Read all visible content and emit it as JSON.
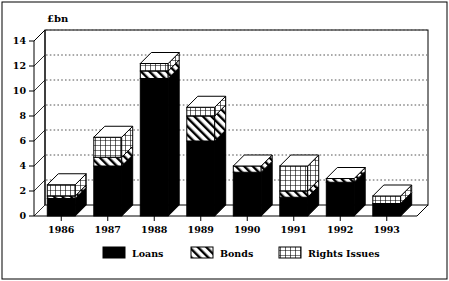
{
  "chart_data": {
    "type": "bar",
    "title": "",
    "subtitle": "",
    "xlabel": "",
    "ylabel": "£bn",
    "unit_label": "£bn",
    "stacked": true,
    "style": "3d-stacked-bar",
    "grid": true,
    "grid_style": "dotted-horizontal",
    "legend_position": "bottom",
    "categories": [
      "1986",
      "1987",
      "1988",
      "1989",
      "1990",
      "1991",
      "1992",
      "1993"
    ],
    "ylim": [
      0,
      14
    ],
    "yticks": [
      0,
      2,
      4,
      6,
      8,
      10,
      12,
      14
    ],
    "ytick_labels": [
      "0",
      "2",
      "4",
      "6",
      "8",
      "10",
      "12",
      "14"
    ],
    "series": [
      {
        "name": "Loans",
        "fill": "solid-black",
        "color": "#000000",
        "values": [
          1.4,
          4.0,
          11.0,
          6.0,
          3.5,
          1.5,
          2.7,
          1.0
        ]
      },
      {
        "name": "Bonds",
        "fill": "diagonal-hatch",
        "color": "#ffffff",
        "values": [
          0.2,
          0.7,
          0.6,
          2.0,
          0.5,
          0.5,
          0.3,
          0.0
        ]
      },
      {
        "name": "Rights Issues",
        "fill": "cross-hatch",
        "color": "#ffffff",
        "values": [
          0.9,
          1.6,
          0.6,
          0.7,
          0.0,
          2.0,
          0.0,
          0.6
        ]
      }
    ],
    "totals": [
      2.5,
      6.3,
      12.2,
      8.7,
      4.0,
      4.0,
      3.0,
      1.6
    ]
  },
  "legend": {
    "items": [
      {
        "label": "Loans",
        "swatch": "solid-black"
      },
      {
        "label": "Bonds",
        "swatch": "diagonal-hatch"
      },
      {
        "label": "Rights Issues",
        "swatch": "cross-hatch"
      }
    ]
  },
  "colors": {
    "ink": "#000000",
    "background": "#ffffff",
    "grid": "#555555"
  }
}
